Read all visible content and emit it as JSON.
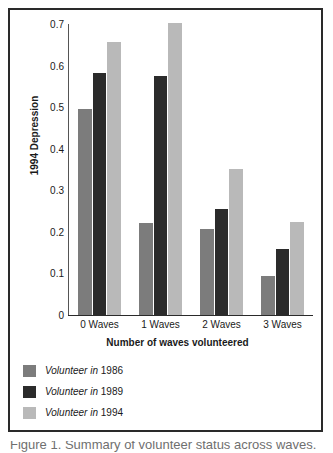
{
  "chart_data": {
    "type": "bar",
    "title": "",
    "subtitle": "",
    "xlabel": "Number of waves volunteered",
    "ylabel": "1994 Depression",
    "categories": [
      "0 Waves",
      "1 Waves",
      "2 Waves",
      "3 Waves"
    ],
    "series": [
      {
        "name": "Volunteer in 1986",
        "color": "#7c7c7c",
        "values": [
          0.495,
          0.222,
          0.208,
          0.093
        ]
      },
      {
        "name": "Volunteer in 1989",
        "color": "#2b2b2b",
        "values": [
          0.583,
          0.575,
          0.255,
          0.159
        ]
      },
      {
        "name": "Volunteer in 1994",
        "color": "#b9b9b9",
        "values": [
          0.656,
          0.702,
          0.352,
          0.224
        ]
      }
    ],
    "ylim": [
      0,
      0.7
    ],
    "yticks": [
      0,
      0.1,
      0.2,
      0.3,
      0.4,
      0.5,
      0.6,
      0.7
    ],
    "ytick_labels": [
      "0",
      "0.1",
      "0.2",
      "0.3",
      "0.4",
      "0.5",
      "0.6",
      "0.7"
    ],
    "grid": false,
    "legend_position": "below-left"
  },
  "legend": {
    "entries": [
      {
        "name_italic": "Volunteer in",
        "year": "1986"
      },
      {
        "name_italic": "Volunteer in",
        "year": "1989"
      },
      {
        "name_italic": "Volunteer in",
        "year": "1994"
      }
    ]
  },
  "caption": {
    "text": "Figure 1. Summary of volunteer status across waves."
  }
}
